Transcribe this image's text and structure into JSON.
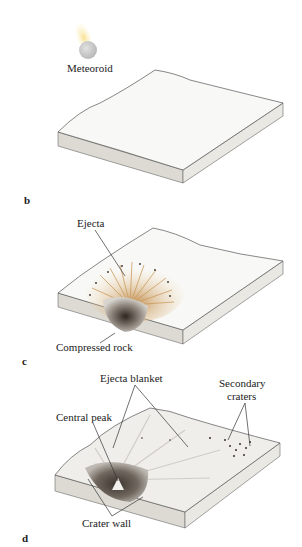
{
  "panels": [
    {
      "id": "b",
      "letter": "b",
      "labels": {
        "meteoroid": "Meteoroid"
      }
    },
    {
      "id": "c",
      "letter": "c",
      "labels": {
        "ejecta": "Ejecta",
        "compressed_rock": "Compressed rock"
      }
    },
    {
      "id": "d",
      "letter": "d",
      "labels": {
        "ejecta_blanket": "Ejecta blanket",
        "secondary_craters_line1": "Secondary",
        "secondary_craters_line2": "craters",
        "central_peak": "Central peak",
        "crater_wall": "Crater wall"
      }
    }
  ],
  "colors": {
    "surface": "#f7f7f5",
    "block_side": "#e6e5df",
    "block_front": "#dcdad3",
    "edge": "#555555",
    "meteoroid": "#c9c9c9",
    "meteoroid_trail": "#f3dc8a",
    "ejecta": "#d9b073",
    "crater_dark": "#3a332c"
  }
}
